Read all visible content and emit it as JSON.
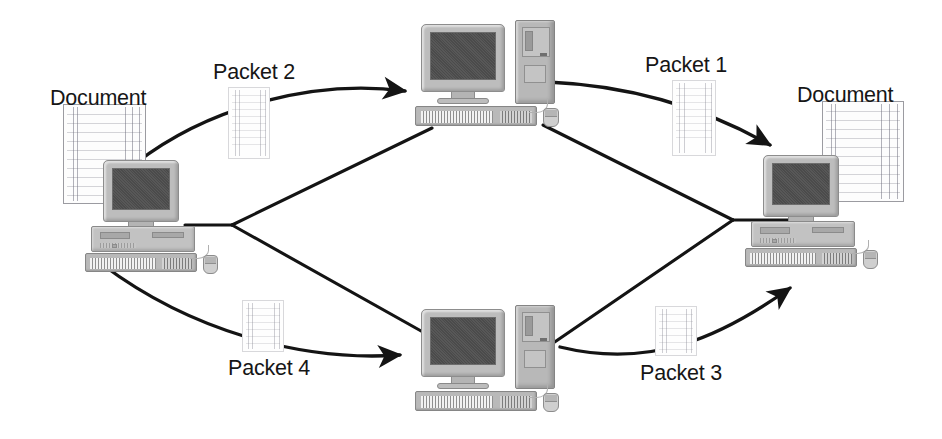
{
  "diagram": {
    "type": "network-packet-routing",
    "background_color": "#ffffff",
    "line_color": "#1a1a1a"
  },
  "labels": {
    "source_document": "Document",
    "destination_document": "Document",
    "packet_1": "Packet 1",
    "packet_2": "Packet 2",
    "packet_3": "Packet 3",
    "packet_4": "Packet 4"
  },
  "nodes": [
    {
      "id": "source",
      "role": "sending-computer",
      "kind": "desktop-pc",
      "x": 85,
      "y": 160
    },
    {
      "id": "router-top",
      "role": "intermediate-router",
      "kind": "workstation",
      "x": 415,
      "y": 20
    },
    {
      "id": "router-bottom",
      "role": "intermediate-router",
      "kind": "workstation",
      "x": 415,
      "y": 305
    },
    {
      "id": "destination",
      "role": "receiving-computer",
      "kind": "desktop-pc",
      "x": 745,
      "y": 155
    }
  ],
  "packets": [
    {
      "label": "Packet 1",
      "path": "router-top to destination",
      "label_x": 645,
      "label_y": 55,
      "page_x": 672,
      "page_y": 80,
      "page_above_text": false
    },
    {
      "label": "Packet 2",
      "path": "source to router-top",
      "label_x": 213,
      "label_y": 62,
      "page_x": 228,
      "page_y": 87,
      "page_above_text": false
    },
    {
      "label": "Packet 3",
      "path": "router-bottom to destination",
      "label_x": 640,
      "label_y": 363,
      "page_x": 655,
      "page_y": 306,
      "page_above_text": true
    },
    {
      "label": "Packet 4",
      "path": "source to router-bottom",
      "label_x": 228,
      "label_y": 358,
      "page_x": 242,
      "page_y": 300,
      "page_above_text": true
    }
  ],
  "documents": [
    {
      "label": "Document",
      "side": "left",
      "label_x": 50,
      "label_y": 88,
      "page_x": 63,
      "page_y": 104
    },
    {
      "label": "Document",
      "side": "right",
      "label_x": 797,
      "label_y": 85,
      "page_x": 822,
      "page_y": 101
    }
  ],
  "connections": {
    "straight_links": [
      "source -> left-junction",
      "left-junction -> router-top",
      "left-junction -> router-bottom",
      "router-top -> right-junction",
      "router-bottom -> right-junction",
      "right-junction -> destination"
    ],
    "curved_arrows": [
      "source -> router-top (Packet 2)",
      "source -> router-bottom (Packet 4)",
      "router-top -> destination (Packet 1)",
      "router-bottom -> destination (Packet 3)"
    ],
    "junction_left": {
      "x": 232,
      "y": 225
    },
    "junction_right": {
      "x": 733,
      "y": 220
    }
  }
}
